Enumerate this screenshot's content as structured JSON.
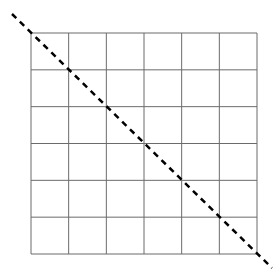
{
  "diagram": {
    "type": "grid-with-diagonal",
    "grid": {
      "rows": 6,
      "cols": 6,
      "x0": 31,
      "y0": 33,
      "x1": 257,
      "y1": 254,
      "line_color": "#6b6b6b",
      "line_width": 1
    },
    "diagonal": {
      "x_start": 12,
      "y_start": 14,
      "x_end": 272,
      "y_end": 268,
      "style": "dashed",
      "color": "#000000",
      "width": 2.5,
      "dash": "6,5"
    }
  }
}
